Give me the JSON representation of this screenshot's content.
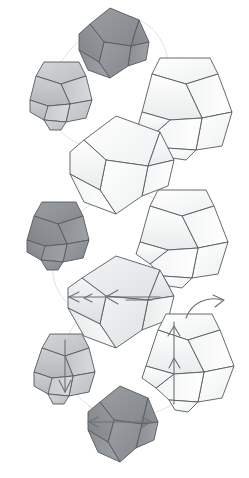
{
  "figure": {
    "title": "",
    "background_color": "#ffffff",
    "width": 249,
    "height": 478,
    "palette": {
      "outline": "#555a5e",
      "arc": "#dcdcdc",
      "arrow": "#6b7075",
      "dark_fill": "#8d9094",
      "dark_fill_2": "#a0a3a7",
      "mid_fill": "#b9bcbf",
      "mid_fill_2": "#c9cbce",
      "light_fill": "#e2e4e6",
      "white_fill": "#f6f7f8",
      "white_fill_2": "#ffffff"
    },
    "shapes": [
      {
        "id": "crystal-top-dark",
        "name": "top-dark-bicone",
        "shade": "dark",
        "tone_hex": "#8d9094",
        "orientation": "horizontal-bicone",
        "center": [
          110,
          43
        ],
        "arrows": []
      },
      {
        "id": "crystal-left-upper",
        "name": "upper-left-grey-bipyramid",
        "shade": "mid",
        "tone_hex": "#c9cbce",
        "orientation": "flat-top-bipyramid",
        "center": [
          61,
          92
        ],
        "arrows": []
      },
      {
        "id": "crystal-right-upper",
        "name": "upper-right-white-bipyramid",
        "shade": "white",
        "tone_hex": "#f6f7f8",
        "orientation": "flat-top-bipyramid",
        "center": [
          186,
          105
        ],
        "arrows": []
      },
      {
        "id": "crystal-center-white",
        "name": "center-white-bicone",
        "shade": "white",
        "tone_hex": "#ffffff",
        "orientation": "horizontal-bicone",
        "center": [
          115,
          166
        ],
        "arrows": []
      },
      {
        "id": "crystal-left-lower",
        "name": "lower-left-dark-bipyramid",
        "shade": "dark",
        "tone_hex": "#a0a3a7",
        "orientation": "flat-top-bipyramid",
        "center": [
          58,
          232
        ],
        "arrows": []
      },
      {
        "id": "crystal-right-lower",
        "name": "lower-right-white-bipyramid",
        "shade": "white",
        "tone_hex": "#f6f7f8",
        "orientation": "flat-top-bipyramid",
        "center": [
          180,
          232
        ],
        "arrows": []
      },
      {
        "id": "crystal-center-arrowed",
        "name": "center-bicone-with-lateral-arrows",
        "shade": "light",
        "tone_hex": "#f0f1f2",
        "orientation": "horizontal-bicone",
        "center": [
          115,
          303
        ],
        "arrows": [
          "left",
          "left",
          "left"
        ]
      },
      {
        "id": "crystal-right-arrowed",
        "name": "lower-right-bipyramid-with-vertical-arrow",
        "shade": "white",
        "tone_hex": "#f4f5f6",
        "orientation": "flat-top-bipyramid",
        "center": [
          186,
          356
        ],
        "arrows": [
          "up",
          "curved-right"
        ]
      },
      {
        "id": "crystal-left-arrowed",
        "name": "lower-left-bipyramid-with-down-arrow",
        "shade": "mid",
        "tone_hex": "#b9bcbf",
        "orientation": "flat-top-bipyramid",
        "center": [
          65,
          368
        ],
        "arrows": [
          "down"
        ]
      },
      {
        "id": "crystal-bottom-dark",
        "name": "bottom-dark-bicone",
        "shade": "dark",
        "tone_hex": "#8d9094",
        "orientation": "horizontal-bicone",
        "center": [
          120,
          428
        ],
        "arrows": [
          "left",
          "right"
        ]
      }
    ],
    "connectors": [
      {
        "id": "arc-upper-ring",
        "name": "upper-connecting-arc"
      },
      {
        "id": "arc-lower-ring",
        "name": "lower-connecting-arc"
      },
      {
        "id": "arc-bottom-left",
        "name": "bottom-left-connector"
      },
      {
        "id": "arc-bottom-right",
        "name": "bottom-right-connector"
      }
    ]
  }
}
